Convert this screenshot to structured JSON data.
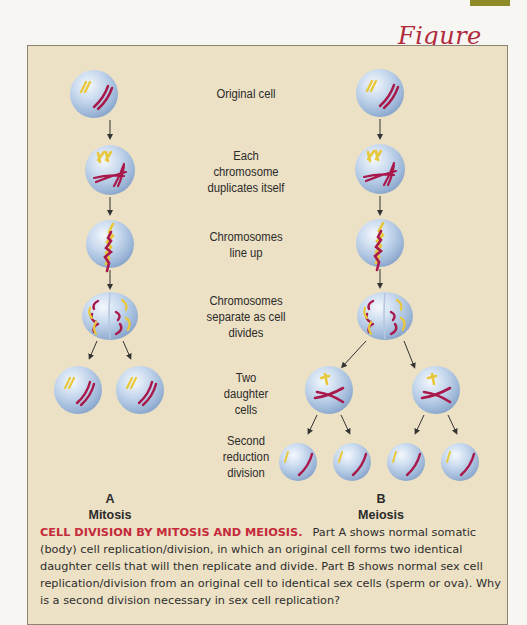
{
  "figure": {
    "label": "Figure 3.6",
    "accent_color": "#b02a3c",
    "panel_color": "#ece1c4"
  },
  "stages": [
    {
      "label": "Original cell"
    },
    {
      "label": "Each chromosome duplicates itself",
      "lines": [
        "Each",
        "chromosome",
        "duplicates itself"
      ]
    },
    {
      "label": "Chromosomes line up",
      "lines": [
        "Chromosomes",
        "line up"
      ]
    },
    {
      "label": "Chromosomes separate as cell divides",
      "lines": [
        "Chromosomes",
        "separate as cell",
        "divides"
      ]
    },
    {
      "label": "Two daughter cells",
      "lines": [
        "Two",
        "daughter",
        "cells"
      ]
    },
    {
      "label": "Second reduction division",
      "lines": [
        "Second",
        "reduction",
        "division"
      ]
    }
  ],
  "columns": {
    "a": {
      "letter": "A",
      "name": "Mitosis"
    },
    "b": {
      "letter": "B",
      "name": "Meiosis"
    }
  },
  "caption": {
    "title": "CELL DIVISION BY MITOSIS AND MEIOSIS.",
    "body": "Part A shows normal somatic (body) cell replication/division, in which an original cell forms two identical daughter cells that will then replicate and divide. Part B shows normal sex cell replication/division from an original cell to identical sex cells (sperm or ova). Why is a second division necessary in sex cell replication?"
  }
}
